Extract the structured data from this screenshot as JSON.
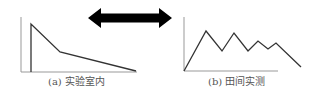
{
  "figure": {
    "panels": [
      {
        "id": "a",
        "caption": "(a) 实验室内",
        "axes": {
          "origin": [
            21,
            72
          ],
          "y_top": 17,
          "x_end": 137
        },
        "polyline": [
          [
            31,
            72
          ],
          [
            31,
            24
          ],
          [
            60,
            52
          ],
          [
            136,
            71
          ]
        ]
      },
      {
        "id": "b",
        "caption": "(b) 田间实测",
        "axes": {
          "origin": [
            184,
            71
          ],
          "y_top": 17,
          "x_end": 278
        },
        "polyline": [
          [
            184,
            71
          ],
          [
            206,
            31
          ],
          [
            222,
            51
          ],
          [
            234,
            33
          ],
          [
            248,
            51
          ],
          [
            258,
            41
          ],
          [
            268,
            49
          ],
          [
            276,
            43
          ],
          [
            301,
            67
          ]
        ]
      }
    ],
    "connector": {
      "type": "double-headed-arrow",
      "x_start": 88,
      "x_end": 172,
      "y_center": 18,
      "color": "#000000"
    },
    "colors": {
      "line": "#333333",
      "axis": "#999999",
      "caption": "#555555"
    }
  }
}
